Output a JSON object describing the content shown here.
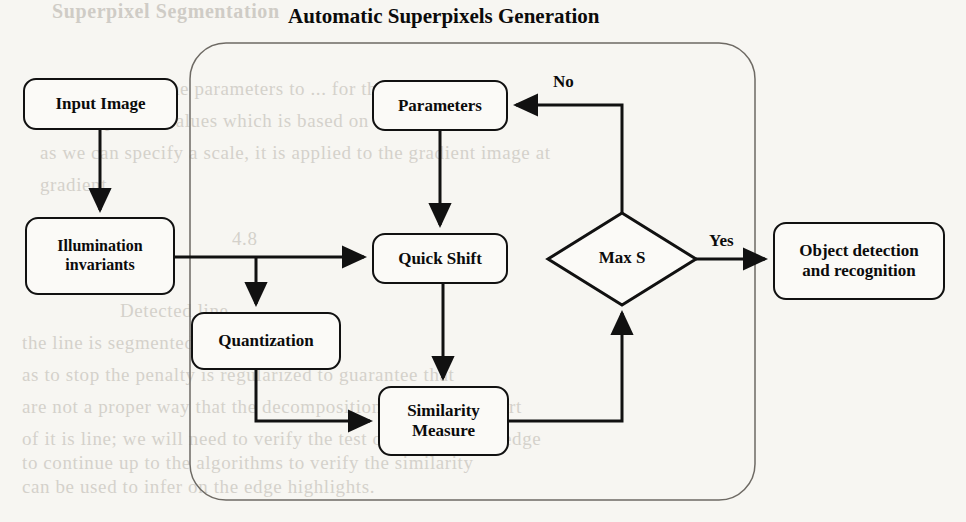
{
  "title": {
    "text": "Automatic Superpixels Generation",
    "x": 288,
    "y": 4,
    "size": 21
  },
  "canvas": {
    "width": 966,
    "height": 522,
    "background": "#f7f6f2"
  },
  "colors": {
    "stroke": "#111111",
    "text": "#0b0b0b",
    "container_stroke": "#6e6a64",
    "page_background": "#f7f6f2",
    "node_fill": "#fbfaf7",
    "bleed_text": "#b9b4ac"
  },
  "container": {
    "name": "Automatic Superpixels Generation",
    "x": 190,
    "y": 43,
    "width": 565,
    "height": 457,
    "radius": 36
  },
  "nodes": [
    {
      "id": "input-image",
      "label": "Input Image",
      "x": 23,
      "y": 78,
      "w": 155,
      "h": 52,
      "size": 17,
      "shape": "rounded-rect"
    },
    {
      "id": "illumination",
      "label": "Illumination\ninvariants",
      "x": 25,
      "y": 217,
      "w": 150,
      "h": 78,
      "size": 16,
      "shape": "rounded-rect"
    },
    {
      "id": "parameters",
      "label": "Parameters",
      "x": 372,
      "y": 80,
      "w": 136,
      "h": 51,
      "size": 17,
      "shape": "rounded-rect"
    },
    {
      "id": "quick-shift",
      "label": "Quick Shift",
      "x": 372,
      "y": 233,
      "w": 136,
      "h": 51,
      "size": 17,
      "shape": "rounded-rect"
    },
    {
      "id": "quantization",
      "label": "Quantization",
      "x": 191,
      "y": 312,
      "w": 150,
      "h": 58,
      "size": 17,
      "shape": "rounded-rect"
    },
    {
      "id": "similarity",
      "label": "Similarity\nMeasure",
      "x": 378,
      "y": 386,
      "w": 131,
      "h": 70,
      "size": 17,
      "shape": "rounded-rect"
    },
    {
      "id": "object-detection",
      "label": "Object detection\nand recognition",
      "x": 773,
      "y": 222,
      "w": 172,
      "h": 78,
      "size": 17,
      "shape": "rounded-rect"
    }
  ],
  "decision": {
    "id": "max-s",
    "label": "Max S",
    "cx": 622,
    "cy": 259,
    "rx": 74,
    "ry": 46,
    "size": 17
  },
  "edges": [
    {
      "id": "input-to-illumination",
      "from": "input-image",
      "to": "illumination",
      "label": ""
    },
    {
      "id": "illumination-to-quickshift",
      "from": "illumination",
      "to": "quick-shift",
      "label": ""
    },
    {
      "id": "illumination-to-quantization",
      "from": "illumination",
      "to": "quantization",
      "label": ""
    },
    {
      "id": "parameters-to-quickshift",
      "from": "parameters",
      "to": "quick-shift",
      "label": ""
    },
    {
      "id": "quickshift-to-similarity",
      "from": "quick-shift",
      "to": "similarity",
      "label": ""
    },
    {
      "id": "quantization-to-similarity",
      "from": "quantization",
      "to": "similarity",
      "label": ""
    },
    {
      "id": "similarity-to-maxs",
      "from": "similarity",
      "to": "max-s",
      "label": ""
    },
    {
      "id": "maxs-to-parameters",
      "from": "max-s",
      "to": "parameters",
      "label": "No"
    },
    {
      "id": "maxs-to-objectdetection",
      "from": "max-s",
      "to": "object-detection",
      "label": "Yes"
    }
  ],
  "edge_labels": {
    "no": {
      "text": "No",
      "x": 553,
      "y": 72,
      "size": 17
    },
    "yes": {
      "text": "Yes",
      "x": 709,
      "y": 231,
      "size": 17
    }
  },
  "bleed_text": [
    {
      "text": "Superpixel Segmentation",
      "x": 52,
      "y": 0,
      "bold": true
    },
    {
      "text": "We usually set the parameters to ... for the",
      "x": 40,
      "y": 78,
      "bold": false
    },
    {
      "text": "the component values which is based on a pixel at a time",
      "x": 40,
      "y": 110,
      "bold": false
    },
    {
      "text": "as we can specify a scale, it is applied to the gradient image at",
      "x": 40,
      "y": 142,
      "bold": false
    },
    {
      "text": "gradient.",
      "x": 40,
      "y": 174,
      "bold": false
    },
    {
      "text": "4.8",
      "x": 232,
      "y": 228,
      "bold": false
    },
    {
      "text": "Detected line",
      "x": 120,
      "y": 300,
      "bold": false
    },
    {
      "text": "the line is segmented in the set of the",
      "x": 22,
      "y": 332,
      "bold": false
    },
    {
      "text": "as to stop the penalty is regularized to guarantee that",
      "x": 22,
      "y": 364,
      "bold": false
    },
    {
      "text": "are not a proper way that the decomposition is the way a part",
      "x": 22,
      "y": 396,
      "bold": false
    },
    {
      "text": "of it is line; we will need to verify the test of between this edge",
      "x": 22,
      "y": 428,
      "bold": false
    },
    {
      "text": "to continue up to the algorithms to verify the similarity",
      "x": 22,
      "y": 452,
      "bold": false
    },
    {
      "text": "can be used to infer on the edge highlights.",
      "x": 22,
      "y": 476,
      "bold": false
    }
  ]
}
